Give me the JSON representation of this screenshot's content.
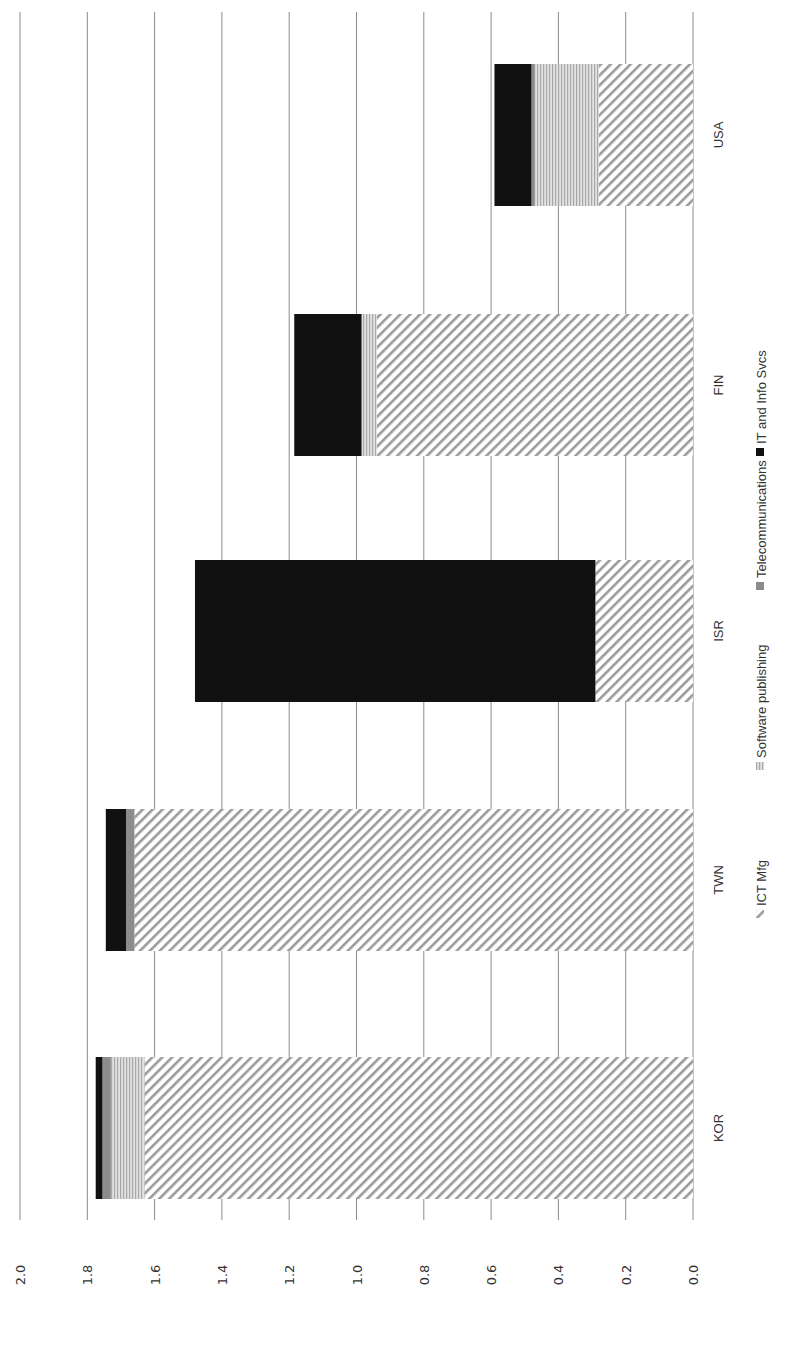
{
  "chart_data": {
    "type": "bar",
    "orientation": "stacked, rotated 90 degrees counter-clockwise",
    "title": "",
    "xlabel": "",
    "ylabel": "",
    "ylim": [
      0,
      2.0
    ],
    "yticks": [
      "0.0",
      "0.2",
      "0.4",
      "0.6",
      "0.8",
      "1.0",
      "1.2",
      "1.4",
      "1.6",
      "1.8",
      "2.0"
    ],
    "grid": true,
    "legend_position": "bottom",
    "categories": [
      "KOR",
      "TWN",
      "ISR",
      "FIN",
      "USA"
    ],
    "series": [
      {
        "name": "ICT Mfg",
        "pattern": "diagonal-hatch",
        "color": "#9a9a9a",
        "values": [
          1.63,
          1.66,
          0.29,
          0.94,
          0.28
        ]
      },
      {
        "name": "Software publishing",
        "pattern": "horizontal-lines",
        "color": "#bdbdbd",
        "values": [
          0.1,
          0.0,
          0.0,
          0.045,
          0.19
        ]
      },
      {
        "name": "Telecommunications",
        "pattern": "solid",
        "color": "#8c8c8c",
        "values": [
          0.025,
          0.025,
          0.0,
          0.0,
          0.01
        ]
      },
      {
        "name": "IT and Info Svcs",
        "pattern": "solid",
        "color": "#111111",
        "values": [
          0.02,
          0.06,
          1.19,
          0.2,
          0.11
        ]
      }
    ]
  },
  "legend": {
    "items": [
      "ICT Mfg",
      "Software publishing",
      "Telecommunications",
      "IT and Info Svcs"
    ]
  }
}
